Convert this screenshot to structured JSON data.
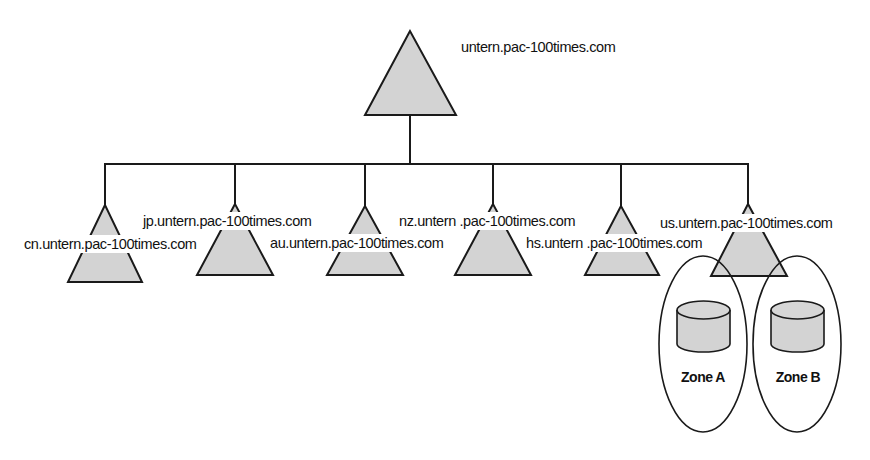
{
  "diagram": {
    "type": "dns-domain-hierarchy",
    "root": {
      "label": "untern.pac-100times.com"
    },
    "children": [
      {
        "label": "cn.untern.pac-100times.com"
      },
      {
        "label": "jp.untern.pac-100times.com"
      },
      {
        "label": "au.untern.pac-100times.com"
      },
      {
        "label": "nz.untern .pac-100times.com"
      },
      {
        "label": "hs.untern .pac-100times.com"
      },
      {
        "label": "us.untern.pac-100times.com"
      }
    ],
    "zones": [
      {
        "label": "Zone A"
      },
      {
        "label": "Zone B"
      }
    ],
    "colors": {
      "shape_fill": "#d3d3d3",
      "stroke": "#1a1a1a",
      "background": "#ffffff"
    }
  }
}
